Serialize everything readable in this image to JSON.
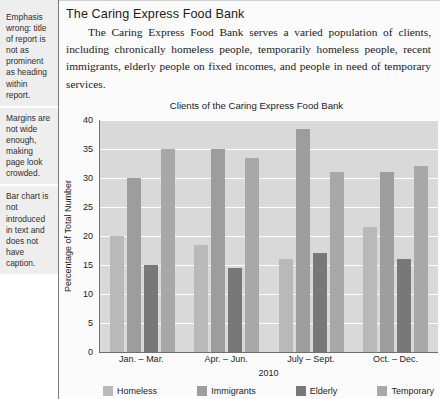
{
  "annotations": [
    {
      "text": "Emphasis wrong: title of report is not as prominent as heading within report."
    },
    {
      "text": "Margins are not wide enough, making page look crowded."
    },
    {
      "text": "Bar chart is not introduced in text and does not have caption."
    }
  ],
  "document": {
    "title": "The Caring Express Food Bank",
    "body": "The Caring Express Food Bank serves a varied population of clients, including chronically homeless people, temporarily homeless people, recent immigrants, elderly people on fixed incomes, and people in need of temporary services."
  },
  "colors": {
    "plot_background": "#d9d9d9",
    "gridline": "#fdfdfd",
    "axis": "#6e6e6e",
    "homeless": "#b9b9b9",
    "immigrants": "#9d9d9d",
    "elderly": "#787878",
    "temporary": "#a8a8a8",
    "note_background": "#eeeeee"
  },
  "chart_data": {
    "type": "bar",
    "title": "Clients of the Caring Express Food Bank",
    "xlabel": "2010",
    "ylabel": "Percentage of Total Number",
    "categories": [
      "Jan. – Mar.",
      "Apr. – Jun.",
      "July – Sept.",
      "Oct. – Dec."
    ],
    "ylim": [
      0,
      40
    ],
    "yticks": [
      0,
      5,
      10,
      15,
      20,
      25,
      30,
      35,
      40
    ],
    "grid": true,
    "legend_position": "bottom",
    "series": [
      {
        "name": "Homeless",
        "color": "#b9b9b9",
        "values": [
          20,
          18.5,
          16,
          21.5
        ]
      },
      {
        "name": "Immigrants",
        "color": "#9d9d9d",
        "values": [
          30,
          35,
          38.5,
          31
        ]
      },
      {
        "name": "Elderly",
        "color": "#787878",
        "values": [
          15,
          14.5,
          17,
          16
        ]
      },
      {
        "name": "Temporary",
        "color": "#a8a8a8",
        "values": [
          35,
          33.5,
          31,
          32
        ]
      }
    ]
  }
}
